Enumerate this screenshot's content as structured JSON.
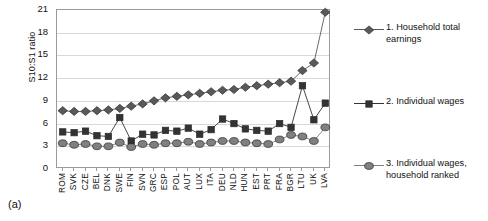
{
  "panel": {
    "label": "(a)"
  },
  "chart_data": {
    "type": "line",
    "title": "",
    "xlabel": "",
    "ylabel": "S10:S1 ratio",
    "ylim": [
      0,
      21
    ],
    "yticks": [
      0,
      3,
      6,
      9,
      12,
      15,
      18,
      21
    ],
    "grid": true,
    "legend_position": "right",
    "categories": [
      "ROM",
      "SVK",
      "CZE",
      "BEL",
      "DNK",
      "SWE",
      "FIN",
      "SVN",
      "GRC",
      "ESP",
      "POL",
      "AUT",
      "LUX",
      "ITA",
      "DEU",
      "NLD",
      "HUN",
      "EST",
      "PRT",
      "FRA",
      "BGR",
      "LTU",
      "UK",
      "LVA"
    ],
    "series": [
      {
        "name": "1. Household total earnings",
        "marker": "diamond",
        "color": "#595959",
        "values": [
          7.7,
          7.6,
          7.6,
          7.7,
          7.8,
          8.0,
          8.3,
          8.6,
          9.0,
          9.4,
          9.6,
          9.8,
          10.0,
          10.2,
          10.4,
          10.5,
          10.8,
          11.0,
          11.2,
          11.4,
          11.6,
          13.0,
          14.0,
          20.7
        ]
      },
      {
        "name": "2. Individual wages",
        "marker": "square",
        "color": "#333333",
        "values": [
          4.9,
          4.8,
          5.0,
          4.4,
          4.3,
          6.8,
          3.7,
          4.6,
          4.5,
          5.1,
          5.0,
          5.4,
          4.6,
          5.2,
          6.6,
          6.0,
          5.3,
          5.1,
          5.0,
          6.0,
          5.5,
          11.0,
          6.5,
          8.7
        ]
      },
      {
        "name": "3. Individual wages, household ranked",
        "marker": "circle",
        "color": "#808080",
        "values": [
          3.4,
          3.2,
          3.3,
          3.0,
          3.0,
          3.5,
          2.9,
          3.3,
          3.2,
          3.4,
          3.4,
          3.6,
          3.3,
          3.5,
          3.7,
          3.7,
          3.5,
          3.4,
          3.3,
          3.9,
          4.5,
          4.3,
          3.7,
          5.5
        ]
      }
    ]
  },
  "legend": {
    "entries": [
      {
        "label": "1. Household total earnings"
      },
      {
        "label": "2. Individual wages"
      },
      {
        "label": "3. Individual wages, household ranked"
      }
    ]
  }
}
